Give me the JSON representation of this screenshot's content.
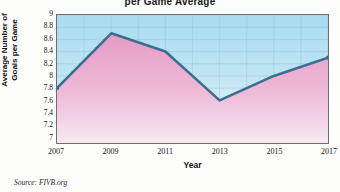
{
  "chart_data": {
    "type": "line",
    "title": "per Game Average",
    "xlabel": "Year",
    "ylabel": "Average Number of Goals per Game",
    "ylabel_line1": "Average Number of",
    "ylabel_line2": "Goals per Game",
    "source": "Source: FIVB.org",
    "x": [
      2007,
      2009,
      2011,
      2013,
      2015,
      2017
    ],
    "values": [
      7.8,
      8.7,
      8.4,
      7.6,
      8.0,
      8.3
    ],
    "categories": [
      "2007",
      "2009",
      "2011",
      "2013",
      "2015",
      "2017"
    ],
    "xlim": [
      2007,
      2017
    ],
    "ylim": [
      6.9,
      9
    ],
    "x_ticks": [
      "2007",
      "2009",
      "2011",
      "2013",
      "2015",
      "2017"
    ],
    "y_ticks": [
      "9",
      "8.8",
      "8.6",
      "8.4",
      "8.2",
      "8",
      "7.8",
      "7.6",
      "7.4",
      "7.2",
      "7"
    ],
    "y_tick_values": [
      9,
      8.8,
      8.6,
      8.4,
      8.2,
      8,
      7.8,
      7.6,
      7.4,
      7.2,
      7
    ],
    "grid": true,
    "legend": "none",
    "colors": {
      "line": "#3c6e8f",
      "fill_top": "#e7a8cb",
      "fill_bottom": "#f6e6f0",
      "plot_bg_top": "#a8dcf0",
      "plot_bg_bottom": "#f3fafd",
      "grid_line": "#8fc6dd",
      "axis": "#6f6f6f"
    }
  }
}
